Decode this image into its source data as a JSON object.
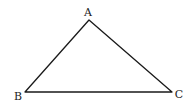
{
  "diagram": {
    "type": "triangle",
    "vertices": [
      {
        "label": "A",
        "x": 89,
        "y": 20,
        "label_x": 88,
        "label_y": 16
      },
      {
        "label": "B",
        "x": 25,
        "y": 92,
        "label_x": 18,
        "label_y": 100
      },
      {
        "label": "C",
        "x": 172,
        "y": 92,
        "label_x": 179,
        "label_y": 98
      }
    ],
    "edges": [
      [
        "A",
        "B"
      ],
      [
        "B",
        "C"
      ],
      [
        "C",
        "A"
      ]
    ],
    "stroke_color": "#1a1a1a",
    "background": "#ffffff"
  }
}
